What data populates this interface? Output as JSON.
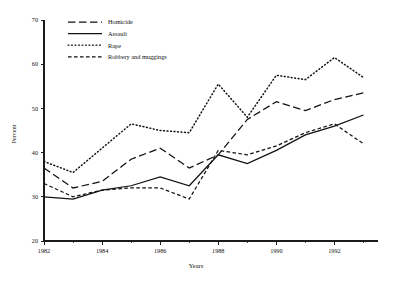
{
  "chart_data": {
    "type": "line",
    "title": "",
    "xlabel": "Years",
    "ylabel": "Percent",
    "xlim": [
      1982,
      1993.5
    ],
    "ylim": [
      20,
      70
    ],
    "grid": false,
    "legend_position": "top-center",
    "x_ticks": [
      1982,
      1984,
      1986,
      1988,
      1990,
      1992
    ],
    "x_tick_labels": [
      "1982",
      "1984",
      "1986",
      "1988",
      "1990",
      "1992"
    ],
    "x_minor_ticks": [
      1983,
      1985,
      1987,
      1989,
      1991,
      1993
    ],
    "y_ticks": [
      20,
      30,
      40,
      50,
      60,
      70
    ],
    "y_tick_labels": [
      "20",
      "30",
      "40",
      "50",
      "60",
      "70"
    ],
    "x": [
      1982,
      1983,
      1984,
      1985,
      1986,
      1987,
      1988,
      1989,
      1990,
      1991,
      1992,
      1993
    ],
    "series": [
      {
        "name": "Homicide",
        "style": "long-dash",
        "values": [
          36.5,
          32.0,
          33.5,
          38.5,
          41.0,
          36.5,
          39.5,
          47.5,
          51.5,
          49.5,
          52.0,
          53.5
        ]
      },
      {
        "name": "Assault",
        "style": "solid",
        "values": [
          30.0,
          29.5,
          31.5,
          32.5,
          34.5,
          32.5,
          39.5,
          37.5,
          40.5,
          44.0,
          46.0,
          48.5
        ]
      },
      {
        "name": "Rape",
        "style": "dotted",
        "values": [
          38.0,
          35.5,
          41.0,
          46.5,
          45.0,
          44.5,
          55.5,
          48.0,
          57.5,
          56.5,
          61.5,
          57.0
        ]
      },
      {
        "name": "Robbery and muggings",
        "style": "dashed",
        "values": [
          33.0,
          30.0,
          31.5,
          32.0,
          32.0,
          29.5,
          40.5,
          39.5,
          41.5,
          44.5,
          46.5,
          42.0
        ]
      }
    ]
  },
  "legend": {
    "items": [
      {
        "label": "Homicide"
      },
      {
        "label": "Assault"
      },
      {
        "label": "Rape"
      },
      {
        "label": "Robbery and muggings"
      }
    ]
  },
  "axes": {
    "x_title": "Years",
    "y_title": "Percent"
  },
  "colors": {
    "ink": "#111111",
    "background": "#ffffff"
  }
}
